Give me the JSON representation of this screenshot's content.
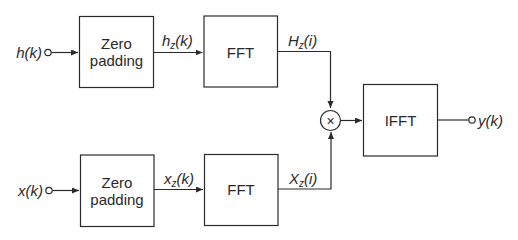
{
  "diagram": {
    "title": "",
    "type": "block-diagram",
    "inputs": [
      {
        "id": "h",
        "label": "h(k)"
      },
      {
        "id": "x",
        "label": "x(k)"
      }
    ],
    "output": {
      "id": "y",
      "label": "y(k)"
    },
    "blocks": {
      "zp_top": {
        "line1": "Zero",
        "line2": "padding"
      },
      "fft_top": {
        "label": "FFT"
      },
      "zp_bottom": {
        "line1": "Zero",
        "line2": "padding"
      },
      "fft_bottom": {
        "label": "FFT"
      },
      "multiplier": {
        "symbol": "×"
      },
      "ifft": {
        "label": "IFFT"
      }
    },
    "signals": {
      "hz": {
        "base": "h",
        "sub": "z",
        "arg": "(k)"
      },
      "Hz": {
        "base": "H",
        "sub": "z",
        "arg": "(i)"
      },
      "xz": {
        "base": "x",
        "sub": "z",
        "arg": "(k)"
      },
      "Xz": {
        "base": "X",
        "sub": "z",
        "arg": "(i)"
      }
    },
    "edges": [
      {
        "from": "h(k)",
        "to": "Zero padding (top)"
      },
      {
        "from": "Zero padding (top)",
        "to": "FFT (top)",
        "label": "hz(k)"
      },
      {
        "from": "FFT (top)",
        "to": "multiplier",
        "label": "Hz(i)"
      },
      {
        "from": "x(k)",
        "to": "Zero padding (bottom)"
      },
      {
        "from": "Zero padding (bottom)",
        "to": "FFT (bottom)",
        "label": "xz(k)"
      },
      {
        "from": "FFT (bottom)",
        "to": "multiplier",
        "label": "Xz(i)"
      },
      {
        "from": "multiplier",
        "to": "IFFT"
      },
      {
        "from": "IFFT",
        "to": "y(k)"
      }
    ],
    "colors": {
      "stroke": "#2a2a2a",
      "background": "#ffffff"
    }
  }
}
